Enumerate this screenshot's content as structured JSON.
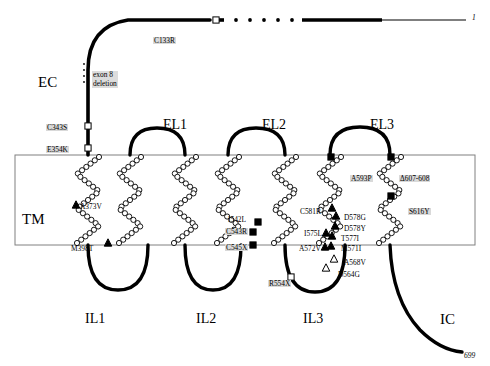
{
  "figure": {
    "type": "receptor-topology-diagram",
    "regions": [
      {
        "id": "EC",
        "label": "EC",
        "x": 38,
        "y": 75
      },
      {
        "id": "TM",
        "label": "TM",
        "x": 22,
        "y": 212
      },
      {
        "id": "IC",
        "label": "IC",
        "x": 440,
        "y": 312
      }
    ],
    "termini": [
      {
        "id": "n-terminus",
        "label": "1",
        "x": 472,
        "y": 14
      },
      {
        "id": "c-terminus",
        "label": "699",
        "x": 464,
        "y": 352
      }
    ],
    "extracellular_loops": [
      {
        "label": "EL1",
        "x": 163,
        "y": 118
      },
      {
        "label": "EL2",
        "x": 262,
        "y": 118
      },
      {
        "label": "EL3",
        "x": 370,
        "y": 118
      }
    ],
    "intracellular_loops": [
      {
        "label": "IL1",
        "x": 85,
        "y": 312
      },
      {
        "label": "IL2",
        "x": 196,
        "y": 312
      },
      {
        "label": "IL3",
        "x": 303,
        "y": 312
      }
    ],
    "exon_deletion": {
      "line1": "exon 8",
      "line2": "deletion",
      "x": 92,
      "y": 71
    },
    "mutations": [
      {
        "label": "C133R",
        "x": 153,
        "y": 37,
        "marker": "open-square",
        "hl": true
      },
      {
        "label": "C343S",
        "x": 46,
        "y": 124,
        "marker": "open-square",
        "hl": true
      },
      {
        "label": "E354K",
        "x": 46,
        "y": 146,
        "marker": "open-square",
        "hl": true
      },
      {
        "label": "A373V",
        "x": 80,
        "y": 203,
        "marker": "filled-triangle",
        "hl": false
      },
      {
        "label": "M398T",
        "x": 71,
        "y": 245,
        "marker": "filled-triangle",
        "hl": false
      },
      {
        "label": "I542L",
        "x": 228,
        "y": 216,
        "marker": "filled-square",
        "hl": false
      },
      {
        "label": "C543R",
        "x": 225,
        "y": 228,
        "marker": "filled-square",
        "hl": true
      },
      {
        "label": "C545X",
        "x": 225,
        "y": 244,
        "marker": "filled-square",
        "hl": true
      },
      {
        "label": "R554X",
        "x": 268,
        "y": 280,
        "marker": "open-square",
        "hl": true
      },
      {
        "label": "D564G",
        "x": 338,
        "y": 271,
        "marker": "open-triangle",
        "hl": false
      },
      {
        "label": "A568V",
        "x": 344,
        "y": 259,
        "marker": "open-triangle",
        "hl": false
      },
      {
        "label": "M571I",
        "x": 341,
        "y": 245,
        "marker": "filled-triangle",
        "hl": false
      },
      {
        "label": "A572V",
        "x": 299,
        "y": 245,
        "marker": "filled-triangle",
        "hl": false
      },
      {
        "label": "T577I",
        "x": 341,
        "y": 235,
        "marker": "filled-triangle",
        "hl": false
      },
      {
        "label": "I575L",
        "x": 304,
        "y": 230,
        "marker": "filled-triangle",
        "hl": false
      },
      {
        "label": "D578Y",
        "x": 344,
        "y": 225,
        "marker": "filled-triangle",
        "hl": false
      },
      {
        "label": "D578G",
        "x": 344,
        "y": 214,
        "marker": "filled-triangle",
        "hl": false
      },
      {
        "label": "C581R",
        "x": 300,
        "y": 208,
        "marker": "filled-triangle",
        "hl": false
      },
      {
        "label": "A593P",
        "x": 350,
        "y": 175,
        "marker": "filled-square",
        "hl": true
      },
      {
        "label": "Δ607-608",
        "x": 399,
        "y": 175,
        "marker": "filled-square",
        "hl": true
      },
      {
        "label": "S616Y",
        "x": 408,
        "y": 208,
        "marker": "filled-square",
        "hl": true
      }
    ],
    "colors": {
      "line": "#000000",
      "box_border": "#808080",
      "highlight": "#d9d9d9",
      "background": "#ffffff"
    }
  }
}
